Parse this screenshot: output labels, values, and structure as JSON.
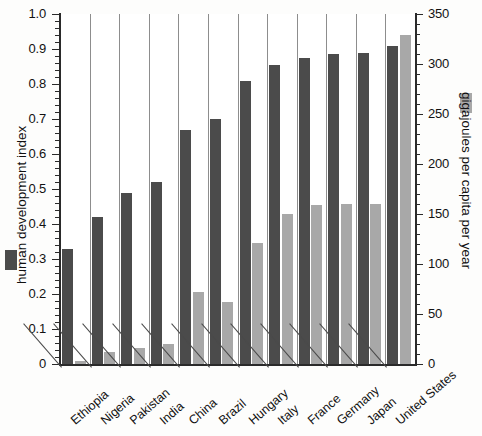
{
  "chart_data": {
    "type": "bar",
    "title": "",
    "subtitle": "",
    "categories": [
      "Ethiopia",
      "Nigeria",
      "Pakistan",
      "India",
      "China",
      "Brazil",
      "Hungary",
      "Italy",
      "France",
      "Germany",
      "Japan",
      "United States"
    ],
    "series": [
      {
        "name": "human development index",
        "axis": "left",
        "color": "#4b4b4b",
        "values": [
          0.33,
          0.42,
          0.49,
          0.52,
          0.67,
          0.7,
          0.81,
          0.855,
          0.875,
          0.885,
          0.89,
          0.91
        ]
      },
      {
        "name": "gigajoules per capita per year",
        "axis": "right",
        "color": "#a8a8a8",
        "values": [
          3,
          12,
          16,
          20,
          72,
          62,
          121,
          150,
          159,
          160,
          160,
          329
        ]
      }
    ],
    "xlabel": "",
    "ylabel": "human development index",
    "ylabel_right": "gigajoules per capita per year",
    "ylim": [
      0,
      1.0
    ],
    "ylim_right": [
      0,
      350
    ],
    "yticks": [
      "0",
      "0.1",
      "0.2",
      "0.3",
      "0.4",
      "0.5",
      "0.6",
      "0.7",
      "0.8",
      "0.9",
      "1.0"
    ],
    "yticks_right": [
      "0",
      "50",
      "100",
      "150",
      "200",
      "250",
      "300",
      "350"
    ],
    "grid": "vertical-separators-between-categories",
    "legend_position": "inline-with-axis-titles"
  }
}
